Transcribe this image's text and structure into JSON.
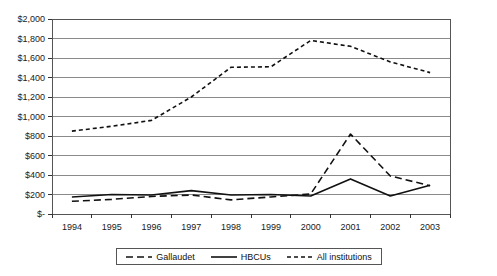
{
  "chart_data": {
    "type": "line",
    "title": "",
    "xlabel": "",
    "ylabel": "",
    "grid": true,
    "legend_position": "bottom",
    "categories": [
      "1994",
      "1995",
      "1996",
      "1997",
      "1998",
      "1999",
      "2000",
      "2001",
      "2002",
      "2003"
    ],
    "ylim": [
      0,
      2000
    ],
    "ytick_values": [
      0,
      200,
      400,
      600,
      800,
      1000,
      1200,
      1400,
      1600,
      1800,
      2000
    ],
    "ytick_labels": [
      "$-",
      "$200",
      "$400",
      "$600",
      "$800",
      "$1,000",
      "$1,200",
      "$1,400",
      "$1,600",
      "$1,800",
      "$2,000"
    ],
    "series": [
      {
        "name": "Gallaudet",
        "style": "long-dash",
        "color": "#111111",
        "values": [
          130,
          150,
          180,
          195,
          145,
          175,
          205,
          820,
          390,
          290
        ]
      },
      {
        "name": "HBCUs",
        "style": "solid",
        "color": "#111111",
        "values": [
          175,
          200,
          195,
          240,
          195,
          200,
          185,
          360,
          185,
          295
        ]
      },
      {
        "name": "All institutions",
        "style": "short-dash",
        "color": "#111111",
        "values": [
          850,
          900,
          960,
          1200,
          1505,
          1510,
          1780,
          1720,
          1560,
          1450
        ]
      }
    ]
  },
  "legend": {
    "items": [
      {
        "label": "Gallaudet",
        "style": "long-dash"
      },
      {
        "label": "HBCUs",
        "style": "solid"
      },
      {
        "label": "All institutions",
        "style": "short-dash"
      }
    ]
  },
  "axes": {
    "frame_color": "#555555",
    "gridline_color": "#8a8a8a"
  }
}
